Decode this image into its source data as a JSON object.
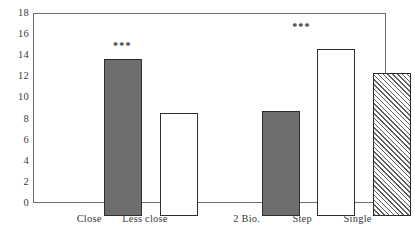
{
  "chart_data": {
    "type": "bar",
    "title": "",
    "subtitle": "",
    "xlabel": "",
    "ylabel": "",
    "ylim": [
      0,
      18
    ],
    "yticks": [
      0,
      2,
      4,
      6,
      8,
      10,
      12,
      14,
      16,
      18
    ],
    "ytick_labels": [
      "0",
      "2",
      "4",
      "6",
      "8",
      "10",
      "12",
      "14",
      "16",
      "18"
    ],
    "grid": false,
    "legend": null,
    "categories": [
      "Close",
      "Less close",
      "2 Bio.",
      "Step",
      "Single"
    ],
    "values": [
      15.0,
      9.9,
      10.1,
      16.0,
      13.7
    ],
    "bars": [
      {
        "label": "Close",
        "value": 15.0,
        "fill": "solid-gray",
        "fill_color": "#6e6e6e",
        "edge_color": "#2e2e2e",
        "annotation": "***",
        "annotation_position": "upper-right",
        "left_pct": 10.3,
        "width_pct": 10.8
      },
      {
        "label": "Less close",
        "value": 9.9,
        "fill": "dotted",
        "fill_color": "#ffffff",
        "edge_color": "#2e2e2e",
        "annotation": "",
        "annotation_position": "",
        "left_pct": 26.2,
        "width_pct": 10.8
      },
      {
        "label": "2 Bio.",
        "value": 10.1,
        "fill": "solid-gray",
        "fill_color": "#6e6e6e",
        "edge_color": "#2e2e2e",
        "annotation": "",
        "annotation_position": "",
        "left_pct": 55.2,
        "width_pct": 10.8
      },
      {
        "label": "Step",
        "value": 16.0,
        "fill": "dotted",
        "fill_color": "#ffffff",
        "edge_color": "#2e2e2e",
        "annotation": "***",
        "annotation_position": "above-center",
        "left_pct": 71.0,
        "width_pct": 10.8
      },
      {
        "label": "Single",
        "value": 13.7,
        "fill": "diagonal-hatch",
        "fill_color": "#ffffff",
        "edge_color": "#2e2e2e",
        "annotation": "",
        "annotation_position": "",
        "left_pct": 86.8,
        "width_pct": 10.8
      }
    ],
    "annotations": [
      {
        "text": "***",
        "refers_to": "Close"
      },
      {
        "text": "***",
        "refers_to": "Step"
      }
    ],
    "colors": {
      "solid_fill": "#6e6e6e",
      "edge": "#2e2e2e",
      "frame": "#6d6d6d",
      "background": "#ffffff",
      "text": "#3a3a3a"
    }
  }
}
